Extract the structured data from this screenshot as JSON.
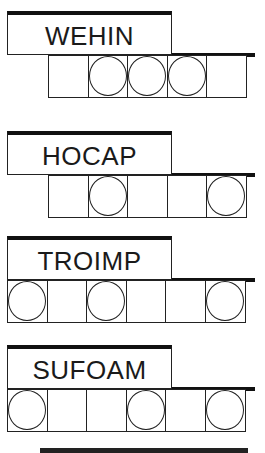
{
  "puzzles": [
    {
      "scrambled": "WEHIN",
      "letter_count": 5,
      "circled_positions": [
        2,
        3,
        4
      ],
      "top": 11
    },
    {
      "scrambled": "HOCAP",
      "letter_count": 5,
      "circled_positions": [
        2,
        5
      ],
      "top": 131
    },
    {
      "scrambled": "TROIMP",
      "letter_count": 6,
      "circled_positions": [
        1,
        3,
        6
      ],
      "top": 236
    },
    {
      "scrambled": "SUFOAM",
      "letter_count": 6,
      "circled_positions": [
        1,
        4,
        6
      ],
      "top": 345
    }
  ],
  "colors": {
    "ink": "#222222",
    "background": "#ffffff"
  }
}
